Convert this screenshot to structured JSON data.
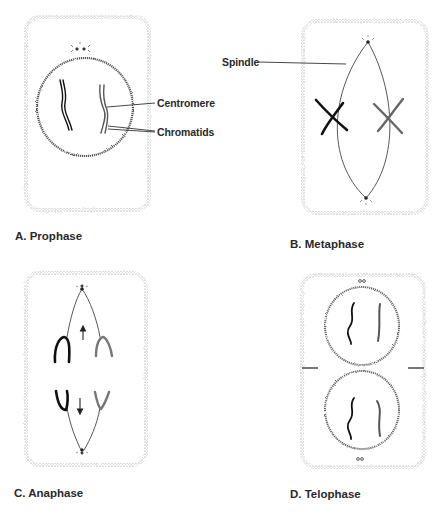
{
  "panels": [
    {
      "id": "A",
      "caption": "A. Prophase"
    },
    {
      "id": "B",
      "caption": "B. Metaphase"
    },
    {
      "id": "C",
      "caption": "C. Anaphase"
    },
    {
      "id": "D",
      "caption": "D. Telophase"
    }
  ],
  "labels": {
    "centromere": "Centromere",
    "chromatids": "Chromatids",
    "spindle": "Spindle"
  },
  "colors": {
    "ink": "#1a1a1a",
    "stipple": "#8a8a8a",
    "background": "#ffffff"
  }
}
